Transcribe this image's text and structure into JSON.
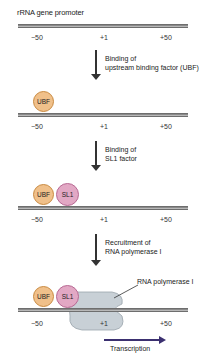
{
  "title": "rRNA gene promoter",
  "ticks": {
    "minus50": "−50",
    "plus1": "+1",
    "plus50": "+50"
  },
  "steps": [
    {
      "line1": "Binding of",
      "line2": "upstream binding factor (UBF)"
    },
    {
      "line1": "Binding of",
      "line2": "SL1 factor"
    },
    {
      "line1": "Recruitment of",
      "line2": "RNA polymerase I"
    }
  ],
  "factors": {
    "ubf": "UBF",
    "sl1": "SL1"
  },
  "polymerase_label": "RNA polymerase I",
  "transcription_label": "Transcription",
  "colors": {
    "ubf_fill": "#f0c08a",
    "sl1_fill": "#e2a8c4",
    "polymerase_fill": "#c8d0d6",
    "transcription_arrow": "#3b3070",
    "dna": "#8a8a8a"
  }
}
